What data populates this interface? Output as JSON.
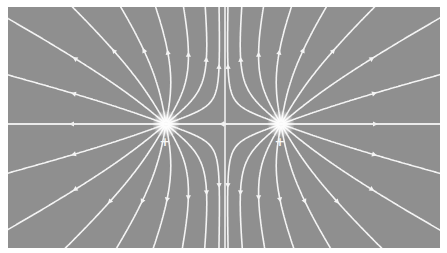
{
  "diagram": {
    "background_color": "#8f8f8f",
    "line_color": "#f4f4f4",
    "frame": {
      "x": 8,
      "y": 7,
      "width": 432,
      "height": 241
    },
    "charges": [
      {
        "id": "left",
        "sign": "+",
        "label": "+",
        "x": 166,
        "y": 124,
        "q": 1
      },
      {
        "id": "right",
        "sign": "+",
        "label": "+",
        "x": 281,
        "y": 124,
        "q": 1
      }
    ],
    "lines_per_charge": 18,
    "arrow_direction": "outward",
    "center_vertical_line_x": 225,
    "horizontal_axis_y": 124
  }
}
